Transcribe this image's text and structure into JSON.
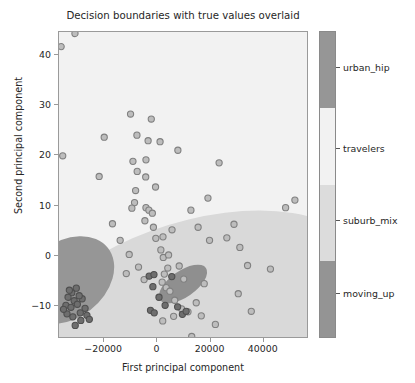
{
  "chart_data": {
    "type": "scatter",
    "title": "Decision boundaries with true values overlaid",
    "xlabel": "First principal component",
    "ylabel": "Second principal component",
    "xlim": [
      -37000,
      57000
    ],
    "ylim": [
      -16.5,
      44.5
    ],
    "xticks": [
      -20000,
      0,
      20000,
      40000
    ],
    "xticklabels": [
      "−20000",
      "0",
      "20000",
      "40000"
    ],
    "yticks": [
      40,
      30,
      20,
      10,
      0,
      -10
    ],
    "yticklabels": [
      "40",
      "30",
      "20",
      "10",
      "0",
      "−10"
    ],
    "grid": false,
    "legend_position": "colorbar-right",
    "point_facecolor": "#bdbdbd",
    "point_edgecolor": "#808080",
    "point_dark_facecolor": "#6e6e6e",
    "point_dark_edgecolor": "#4f4f4f",
    "region_colors": {
      "urban_hip": "#969696",
      "travelers": "#f2f2f2",
      "suburb_mix": "#d9d9d9",
      "moving_up": "#8f8f8f"
    },
    "colorbar": {
      "labels": [
        "urban_hip",
        "travelers",
        "suburb_mix",
        "moving_up"
      ],
      "segment_colors": [
        "#969696",
        "#f2f2f2",
        "#dcdcdc",
        "#949494"
      ],
      "segment_tops_pct": [
        0,
        25,
        50,
        75
      ],
      "segment_heights_pct": [
        25,
        25,
        25,
        25
      ],
      "tick_positions_pct": [
        11.7,
        38.1,
        61.6,
        85.3
      ]
    },
    "regions": [
      {
        "name": "travelers-background",
        "shape": "rect",
        "color": "#f2f2f2"
      },
      {
        "name": "suburb_mix-region",
        "shape": "ellipse",
        "cx": 130,
        "cy": 300,
        "rx": 195,
        "ry": 108,
        "rotation": -20,
        "color": "#d9d9d9"
      },
      {
        "name": "urban_hip-region",
        "shape": "ellipse",
        "cx": 8,
        "cy": 248,
        "rx": 52,
        "ry": 38,
        "rotation": -38,
        "color": "#969696"
      },
      {
        "name": "moving_up-region",
        "shape": "ellipse",
        "cx": 124,
        "cy": 252,
        "rx": 28,
        "ry": 13,
        "rotation": -35,
        "color": "#8f8f8f"
      }
    ],
    "points_light": [
      [
        -36200,
        41.6
      ],
      [
        -31000,
        44.2
      ],
      [
        -35600,
        19.9
      ],
      [
        -10100,
        28.2
      ],
      [
        -2300,
        27.2
      ],
      [
        -20000,
        23.6
      ],
      [
        -7700,
        24.0
      ],
      [
        -3500,
        22.9
      ],
      [
        1000,
        22.7
      ],
      [
        -9200,
        18.8
      ],
      [
        -4300,
        19.1
      ],
      [
        7700,
        21.0
      ],
      [
        -7600,
        16.8
      ],
      [
        -4400,
        15.7
      ],
      [
        -21900,
        15.8
      ],
      [
        -8200,
        13.0
      ],
      [
        -8600,
        10.6
      ],
      [
        -9600,
        9.5
      ],
      [
        -4300,
        9.6
      ],
      [
        -3200,
        9.1
      ],
      [
        -4700,
        7.0
      ],
      [
        -1900,
        8.5
      ],
      [
        23200,
        18.5
      ],
      [
        12600,
        9.1
      ],
      [
        15300,
        5.7
      ],
      [
        19600,
        3.1
      ],
      [
        5500,
        5.2
      ],
      [
        2100,
        3.8
      ],
      [
        -600,
        3.5
      ],
      [
        1300,
        1.2
      ],
      [
        2200,
        -0.3
      ],
      [
        4200,
        0.2
      ],
      [
        3900,
        -2.4
      ],
      [
        2600,
        -3.6
      ],
      [
        1800,
        -5.2
      ],
      [
        3300,
        -6.3
      ],
      [
        4700,
        -7.0
      ],
      [
        -5000,
        -4.7
      ],
      [
        -7100,
        -2.2
      ],
      [
        -11700,
        -3.5
      ],
      [
        -14000,
        3.1
      ],
      [
        -16900,
        6.4
      ],
      [
        8200,
        -2.0
      ],
      [
        9900,
        -4.6
      ],
      [
        6500,
        -8.8
      ],
      [
        2000,
        -12.9
      ],
      [
        6100,
        -12.0
      ],
      [
        9100,
        -10.5
      ],
      [
        14600,
        -9.3
      ],
      [
        11500,
        -11.1
      ],
      [
        12900,
        -16.0
      ],
      [
        16500,
        -11.9
      ],
      [
        26100,
        3.6
      ],
      [
        28800,
        6.3
      ],
      [
        31000,
        1.7
      ],
      [
        33900,
        -1.9
      ],
      [
        42500,
        -2.6
      ],
      [
        48200,
        9.6
      ],
      [
        30400,
        -7.5
      ],
      [
        35300,
        -11.0
      ],
      [
        51700,
        11.1
      ],
      [
        -700,
        13.7
      ],
      [
        -1500,
        5.7
      ],
      [
        -10600,
        0.3
      ],
      [
        19000,
        11.5
      ],
      [
        17600,
        -5.5
      ],
      [
        21800,
        -13.6
      ]
    ],
    "points_dark": [
      [
        -30500,
        -6.4
      ],
      [
        -32200,
        -7.3
      ],
      [
        -33600,
        -8.2
      ],
      [
        -31300,
        -8.9
      ],
      [
        -34400,
        -9.8
      ],
      [
        -32500,
        -10.2
      ],
      [
        -30100,
        -9.6
      ],
      [
        -28300,
        -8.5
      ],
      [
        -27200,
        -10.4
      ],
      [
        -29000,
        -11.3
      ],
      [
        -31800,
        -12.1
      ],
      [
        -34000,
        -11.5
      ],
      [
        -35300,
        -10.6
      ],
      [
        -28800,
        -12.8
      ],
      [
        -26500,
        -11.8
      ],
      [
        -30900,
        -13.8
      ],
      [
        -33100,
        -6.8
      ],
      [
        -29400,
        -7.9
      ],
      [
        -25600,
        -12.6
      ],
      [
        600,
        -8.2
      ],
      [
        2900,
        -9.8
      ],
      [
        -1700,
        -6.1
      ],
      [
        -2600,
        -10.8
      ],
      [
        -1200,
        -11.3
      ],
      [
        5400,
        -4.1
      ],
      [
        -3100,
        -4.0
      ],
      [
        -1300,
        -3.7
      ],
      [
        7600,
        -10.1
      ],
      [
        9400,
        -11.6
      ],
      [
        10800,
        -11.0
      ]
    ]
  }
}
